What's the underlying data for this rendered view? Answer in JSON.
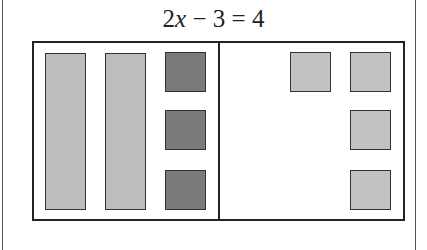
{
  "equation": {
    "coefficient": "2",
    "variable": "x",
    "rest": " − 3 = 4",
    "full_text": "2x − 3 = 4"
  },
  "mat": {
    "left_side": {
      "x_tiles": [
        {
          "label": "x",
          "left": 45,
          "top": 53,
          "width": 41,
          "height": 157
        },
        {
          "label": "x",
          "left": 105,
          "top": 53,
          "width": 41,
          "height": 157
        }
      ],
      "negative_unit_tiles": [
        {
          "label": "-1",
          "left": 165,
          "top": 52,
          "width": 41,
          "height": 40
        },
        {
          "label": "-1",
          "left": 165,
          "top": 110,
          "width": 41,
          "height": 40
        },
        {
          "label": "-1",
          "left": 165,
          "top": 170,
          "width": 41,
          "height": 40
        }
      ]
    },
    "right_side": {
      "positive_unit_tiles": [
        {
          "label": "1",
          "left": 290,
          "top": 52,
          "width": 41,
          "height": 40
        },
        {
          "label": "1",
          "left": 350,
          "top": 52,
          "width": 41,
          "height": 40
        },
        {
          "label": "1",
          "left": 350,
          "top": 110,
          "width": 41,
          "height": 40
        },
        {
          "label": "1",
          "left": 350,
          "top": 170,
          "width": 41,
          "height": 40
        }
      ]
    }
  },
  "colors": {
    "x_tile": "#bdbdbd",
    "negative_unit": "#7a7a7a",
    "positive_unit": "#c2c2c2",
    "border": "#222222"
  }
}
